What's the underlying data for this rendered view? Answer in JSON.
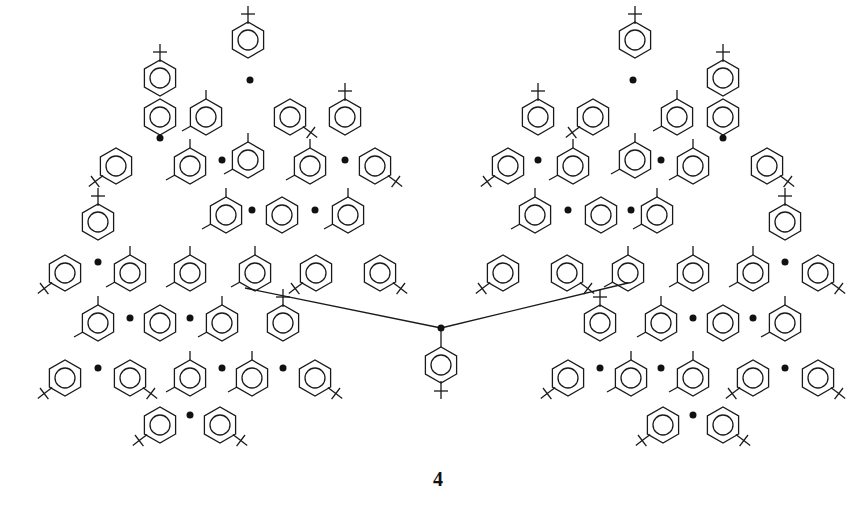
{
  "figure": {
    "compound_label": "4",
    "colors": {
      "line": "#1a1a1a",
      "background": "#ffffff"
    },
    "substituents": [
      "tert-butyl",
      "methyl"
    ],
    "radical_marker": "dot"
  },
  "rings": [
    {
      "x": 248,
      "y": 40,
      "tbu": "up"
    },
    {
      "x": 290,
      "y": 117,
      "tbu": "dr"
    },
    {
      "x": 206,
      "y": 117,
      "me": true
    },
    {
      "x": 160,
      "y": 117
    },
    {
      "x": 160,
      "y": 78,
      "tbu": "up"
    },
    {
      "x": 116,
      "y": 166,
      "tbu": "dl"
    },
    {
      "x": 190,
      "y": 166,
      "me": true
    },
    {
      "x": 248,
      "y": 160,
      "me": true
    },
    {
      "x": 345,
      "y": 117,
      "tbu": "up"
    },
    {
      "x": 310,
      "y": 166,
      "me": true
    },
    {
      "x": 375,
      "y": 166,
      "tbu": "dr"
    },
    {
      "x": 226,
      "y": 215,
      "me": true
    },
    {
      "x": 282,
      "y": 215
    },
    {
      "x": 348,
      "y": 215,
      "me": true
    },
    {
      "x": 98,
      "y": 222,
      "tbu": "up"
    },
    {
      "x": 65,
      "y": 273,
      "tbu": "dl"
    },
    {
      "x": 130,
      "y": 273,
      "me": true
    },
    {
      "x": 190,
      "y": 273,
      "me": true
    },
    {
      "x": 255,
      "y": 273,
      "me": true
    },
    {
      "x": 316,
      "y": 273,
      "tbu": "dl"
    },
    {
      "x": 380,
      "y": 273,
      "tbu": "dr"
    },
    {
      "x": 98,
      "y": 323,
      "me": true
    },
    {
      "x": 160,
      "y": 323
    },
    {
      "x": 222,
      "y": 323,
      "me": true
    },
    {
      "x": 283,
      "y": 323,
      "tbu": "up"
    },
    {
      "x": 65,
      "y": 378,
      "tbu": "dl"
    },
    {
      "x": 130,
      "y": 378,
      "tbu": "dr"
    },
    {
      "x": 190,
      "y": 378,
      "me": true
    },
    {
      "x": 252,
      "y": 378,
      "me": true
    },
    {
      "x": 315,
      "y": 378,
      "tbu": "dr"
    },
    {
      "x": 160,
      "y": 425,
      "tbu": "dl"
    },
    {
      "x": 220,
      "y": 425,
      "tbu": "dr"
    },
    {
      "x": 441,
      "y": 365,
      "tbu": "down"
    }
  ],
  "center_radical": {
    "x": 441,
    "y": 328
  }
}
